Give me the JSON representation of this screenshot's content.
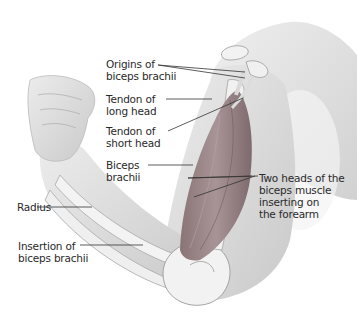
{
  "figure": {
    "labels": {
      "origins": "Origins of\nbiceps brachii",
      "tendon_long": "Tendon of\nlong head",
      "tendon_short": "Tendon of\nshort head",
      "biceps": "Biceps\nbrachii",
      "two_heads": "Two heads of the\nbiceps muscle\ninserting on\nthe forearm",
      "radius": "Radius",
      "insertion": "Insertion of\nbiceps brachii"
    },
    "colors": {
      "skin": "#e4e4e4",
      "skin_shadow": "#bdbdbd",
      "bone": "#f2f2f2",
      "muscle": "#9c8a8c",
      "muscle_dark": "#7a6668",
      "leader": "#333333"
    }
  }
}
